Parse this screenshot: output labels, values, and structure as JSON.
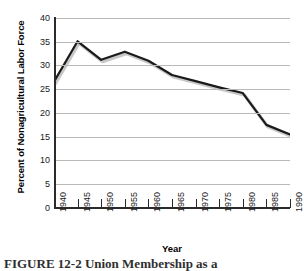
{
  "chart_data": {
    "type": "line",
    "title": "",
    "xlabel": "Year",
    "ylabel": "Percent of Nonagricultural Labor Force",
    "x": [
      1940,
      1945,
      1950,
      1955,
      1960,
      1965,
      1970,
      1975,
      1980,
      1985,
      1990
    ],
    "categories": [
      "1940",
      "1945",
      "1950",
      "1955",
      "1960",
      "1965",
      "1970",
      "1975",
      "1980",
      "1985",
      "1990"
    ],
    "values": [
      26.6,
      35.1,
      31.2,
      32.9,
      31.0,
      28.0,
      26.7,
      25.4,
      24.2,
      17.5,
      15.5
    ],
    "series": [
      {
        "name": "Percent of Nonagricultural Labor Force",
        "values": [
          26.6,
          35.1,
          31.2,
          32.9,
          31.0,
          28.0,
          26.7,
          25.4,
          24.2,
          17.5,
          15.5
        ]
      }
    ],
    "ylim": [
      0,
      40
    ],
    "xlim": [
      1940,
      1990
    ],
    "ytick_labels": [
      "0",
      "5",
      "10",
      "15",
      "20",
      "25",
      "30",
      "35",
      "40"
    ],
    "ytick_values": [
      0,
      5,
      10,
      15,
      20,
      25,
      30,
      35,
      40
    ],
    "xtick_labels": [
      "1940",
      "1945",
      "1950",
      "1955",
      "1960",
      "1965",
      "1970",
      "1975",
      "1980",
      "1985",
      "1990"
    ],
    "grid": true,
    "grid_axis": "y",
    "legend": false,
    "legend_position": "none",
    "line_color": "#1a1a1a",
    "grid_color": "#b9b9b9",
    "axis_color": "#2b2b2b",
    "background_color": "#ffffff",
    "xtick_rotation": -90
  },
  "caption": {
    "text": "FIGURE 12-2 Union Membership as a"
  }
}
